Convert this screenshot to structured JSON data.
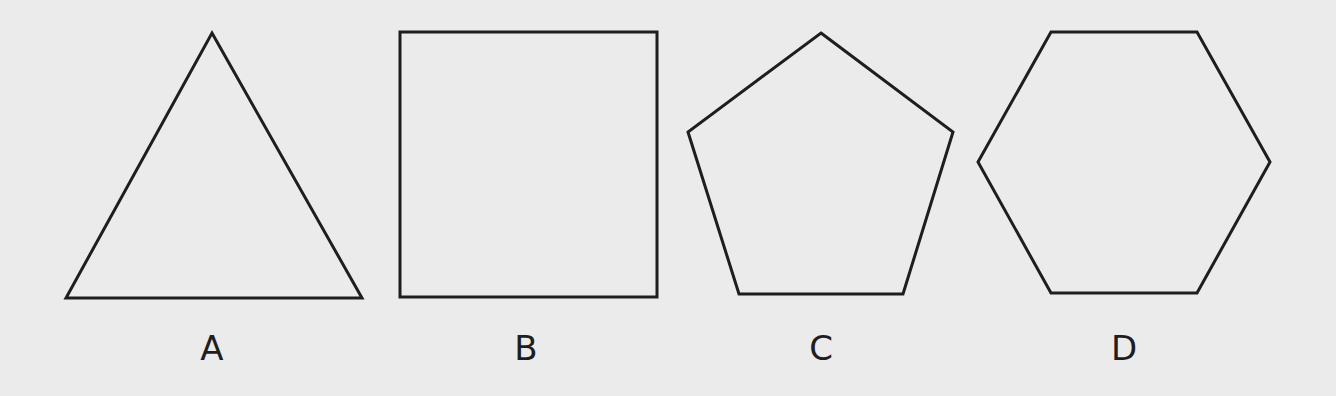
{
  "figure": {
    "background": "#ebebeb",
    "stroke_color": "#1e1e1e",
    "shapes": [
      {
        "label": "A",
        "type": "triangle",
        "sides": 3,
        "points": "212,33 362,298 66,298",
        "label_x": 212
      },
      {
        "label": "B",
        "type": "square",
        "sides": 4,
        "points": "400,32 657,32 657,297 400,297",
        "label_x": 526
      },
      {
        "label": "C",
        "type": "pentagon",
        "sides": 5,
        "points": "821,33 953,132 903,294 739,294 688,132",
        "label_x": 821
      },
      {
        "label": "D",
        "type": "hexagon",
        "sides": 6,
        "points": "1051,32 1197,32 1270,162 1197,293 1051,293 978,162",
        "label_x": 1124
      }
    ]
  }
}
